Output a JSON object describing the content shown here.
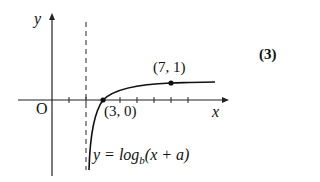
{
  "figure": {
    "number_label": "(3)",
    "axes": {
      "x_label": "x",
      "y_label": "y",
      "origin_label": "O"
    },
    "points": [
      {
        "label": "(3, 0)",
        "x": 3,
        "y": 0
      },
      {
        "label": "(7, 1)",
        "x": 7,
        "y": 1
      }
    ],
    "asymptote": {
      "x": 2,
      "style": "dashed"
    },
    "curve_equation": {
      "prefix": "y = log",
      "base": "b",
      "arg": "(x + a)"
    }
  }
}
